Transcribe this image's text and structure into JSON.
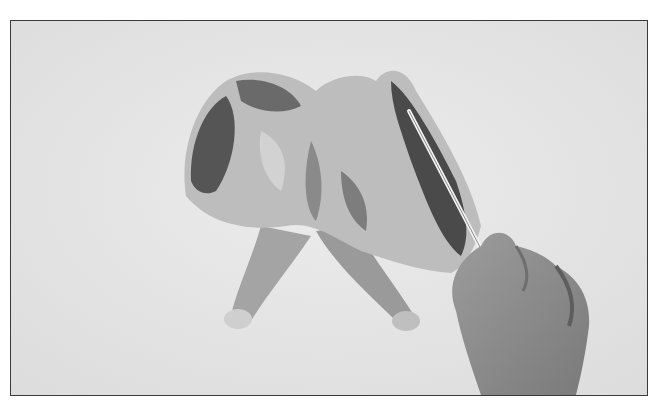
{
  "image": {
    "kind": "photograph",
    "style": "grayscale",
    "subject": "hand cutting along the backbone of a spatchcocked raw chicken with a knife",
    "background_color": "#e4e4e4",
    "border_color": "#3a3a3a"
  }
}
